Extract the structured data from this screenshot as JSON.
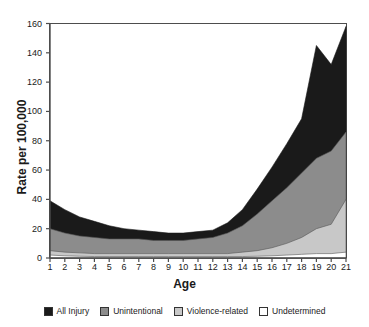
{
  "chart_data": {
    "type": "area",
    "stacked": true,
    "title": "",
    "xlabel": "Age",
    "ylabel": "Rate per 100,000",
    "xlim": [
      1,
      21
    ],
    "ylim": [
      0,
      160
    ],
    "grid": false,
    "legend_position": "bottom",
    "x": [
      1,
      2,
      3,
      4,
      5,
      6,
      7,
      8,
      9,
      10,
      11,
      12,
      13,
      14,
      15,
      16,
      17,
      18,
      19,
      20,
      21
    ],
    "xticks": [
      "1",
      "2",
      "3",
      "4",
      "5",
      "6",
      "7",
      "8",
      "9",
      "10",
      "11",
      "12",
      "13",
      "14",
      "15",
      "16",
      "17",
      "18",
      "19",
      "20",
      "21"
    ],
    "yticks": [
      0,
      20,
      40,
      60,
      80,
      100,
      120,
      140,
      160
    ],
    "series": [
      {
        "name": "All Injury",
        "color": "#1a1a1a",
        "note": "topmost boundary = total injury rate",
        "values": [
          39,
          33,
          28,
          25,
          22,
          20,
          19,
          18,
          17,
          17,
          18,
          19,
          24,
          33,
          47,
          62,
          78,
          95,
          112,
          120,
          133
        ]
      },
      {
        "name": "Unintentional",
        "color": "#8c8c8c",
        "note": "boundary below All Injury band",
        "values": [
          20,
          17,
          15,
          14,
          13,
          13,
          13,
          12,
          12,
          12,
          13,
          14,
          17,
          22,
          30,
          39,
          48,
          58,
          68,
          73,
          86
        ]
      },
      {
        "name": "Violence-related",
        "color": "#c4c4c4",
        "note": "boundary below Unintentional band",
        "values": [
          5,
          4,
          3.5,
          3,
          3,
          3,
          3,
          3,
          3,
          3,
          3,
          3,
          3,
          4,
          5,
          7,
          10,
          14,
          20,
          23,
          40
        ]
      },
      {
        "name": "Undetermined",
        "color": "#ffffff",
        "note": "thin bottom band at baseline",
        "values": [
          2,
          1.5,
          1.2,
          1,
          1,
          1,
          1,
          1,
          1,
          1,
          1,
          1,
          1,
          1,
          1.2,
          1.5,
          2,
          2.5,
          3,
          3,
          4
        ]
      }
    ],
    "total_boundary_points": [
      [
        1,
        39
      ],
      [
        2,
        33
      ],
      [
        3,
        28
      ],
      [
        4,
        25
      ],
      [
        5,
        22
      ],
      [
        6,
        20
      ],
      [
        7,
        19
      ],
      [
        8,
        18
      ],
      [
        9,
        17
      ],
      [
        10,
        17
      ],
      [
        11,
        18
      ],
      [
        12,
        19
      ],
      [
        13,
        24
      ],
      [
        14,
        33
      ],
      [
        15,
        47
      ],
      [
        16,
        62
      ],
      [
        17,
        78
      ],
      [
        18,
        95
      ],
      [
        19,
        145
      ],
      [
        20,
        132
      ],
      [
        21,
        158
      ]
    ],
    "annotations": []
  },
  "axis": {
    "ylabel": "Rate per 100,000",
    "xlabel": "Age",
    "yticks": [
      "0",
      "20",
      "40",
      "60",
      "80",
      "100",
      "120",
      "140",
      "160"
    ],
    "xticks": [
      "1",
      "2",
      "3",
      "4",
      "5",
      "6",
      "7",
      "8",
      "9",
      "10",
      "11",
      "12",
      "13",
      "14",
      "15",
      "16",
      "17",
      "18",
      "19",
      "20",
      "21"
    ]
  },
  "legend": {
    "items": [
      {
        "label": "All Injury",
        "color": "#1a1a1a",
        "swatch": "legend-swatch-all-injury"
      },
      {
        "label": "Unintentional",
        "color": "#8c8c8c",
        "swatch": "legend-swatch-unintentional"
      },
      {
        "label": "Violence-related",
        "color": "#c8c8c8",
        "swatch": "legend-swatch-violence-related"
      },
      {
        "label": "Undetermined",
        "color": "#ffffff",
        "swatch": "legend-swatch-undetermined"
      }
    ]
  },
  "colors": {
    "all_injury": "#1a1a1a",
    "unintentional": "#8c8c8c",
    "violence_related": "#c8c8c8",
    "undetermined": "#ffffff",
    "axis": "#4d4d4d",
    "text": "#1a1a1a",
    "background": "#ffffff"
  }
}
